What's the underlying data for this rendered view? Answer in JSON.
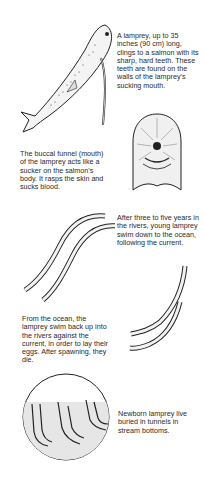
{
  "captions": {
    "salmon": "A lamprey, up to 35 inches (90 cm) long, clings to a salmon with its sharp, hard teeth. These teeth are found on the walls of the lamprey's sucking mouth.",
    "funnel": "The buccal funnel (mouth) of the lamprey acts like a sucker on the salmon's body. It rasps the skin and sucks blood.",
    "downstream": "After three to five years in the rivers, young lamprey swim down to the ocean, following the current.",
    "upstream": "From the ocean, the lamprey swim back up into the rivers against the current, in order to lay their eggs. After spawning, they die.",
    "newborn": "Newborn lamprey live buried in tunnels in stream bottoms."
  }
}
